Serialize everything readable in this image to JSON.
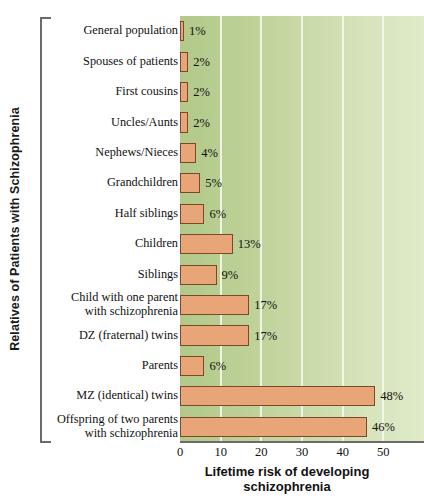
{
  "axis_titles": {
    "y": "Relatives of Patients with Schizophrenia",
    "x_line1": "Lifetime risk of developing",
    "x_line2": "schizophrenia"
  },
  "colors": {
    "bar_fill": "#E7A578",
    "bar_border": "#7A4A28",
    "plot_bg_left": "#B2C98A",
    "plot_bg_right": "#E0EBC9",
    "gridline": "#F3F7EA",
    "axis_line": "#6B6B6B",
    "text": "#111111"
  },
  "chart_data": {
    "type": "bar",
    "orientation": "horizontal",
    "title": "",
    "xlabel": "Lifetime risk of developing schizophrenia",
    "ylabel": "Relatives of Patients with Schizophrenia",
    "xlim": [
      0,
      60
    ],
    "ylim": null,
    "grid": true,
    "legend": "none",
    "xticks": [
      0,
      10,
      20,
      30,
      40,
      50
    ],
    "xtick_labels": [
      "0",
      "10",
      "20",
      "30",
      "40",
      "50"
    ],
    "categories": [
      "General population",
      "Spouses of patients",
      "First cousins",
      "Uncles/Aunts",
      "Nephews/Nieces",
      "Grandchildren",
      "Half siblings",
      "Children",
      "Siblings",
      "Child with one parent with schizophrenia",
      "DZ (fraternal) twins",
      "Parents",
      "MZ (identical) twins",
      "Offspring of two parents with schizophrenia"
    ],
    "category_lines": [
      [
        "General population"
      ],
      [
        "Spouses of patients"
      ],
      [
        "First cousins"
      ],
      [
        "Uncles/Aunts"
      ],
      [
        "Nephews/Nieces"
      ],
      [
        "Grandchildren"
      ],
      [
        "Half siblings"
      ],
      [
        "Children"
      ],
      [
        "Siblings"
      ],
      [
        "Child with one parent",
        "with schizophrenia"
      ],
      [
        "DZ (fraternal) twins"
      ],
      [
        "Parents"
      ],
      [
        "MZ (identical) twins"
      ],
      [
        "Offspring of two parents",
        "with schizophrenia"
      ]
    ],
    "values": [
      1,
      2,
      2,
      2,
      4,
      5,
      6,
      13,
      9,
      17,
      17,
      6,
      48,
      46
    ],
    "value_labels": [
      "1%",
      "2%",
      "2%",
      "2%",
      "4%",
      "5%",
      "6%",
      "13%",
      "9%",
      "17%",
      "17%",
      "6%",
      "48%",
      "46%"
    ]
  }
}
